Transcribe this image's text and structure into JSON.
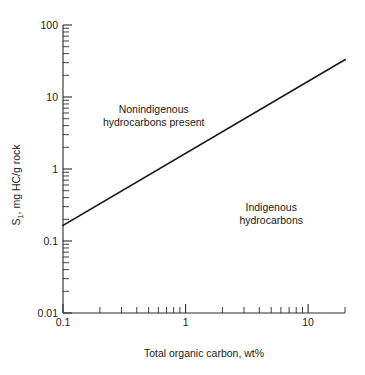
{
  "chart_data": {
    "type": "line",
    "title": "",
    "subtitle": "",
    "xlabel": "Total organic carbon, wt%",
    "ylabel": "S1, mg HC/g rock",
    "ylabel_parts": {
      "base": "S",
      "subscript": "1",
      "rest": ", mg HC/g rock"
    },
    "xscale": "log",
    "yscale": "log",
    "xlim": [
      0.1,
      20
    ],
    "ylim": [
      0.01,
      100
    ],
    "grid": false,
    "legend": "none",
    "x_major_ticks": [
      0.1,
      1,
      10
    ],
    "x_major_tick_labels": [
      "0.1",
      "1",
      "10"
    ],
    "x_minor_ticks": [
      0.2,
      0.3,
      0.4,
      0.5,
      0.6,
      0.7,
      0.8,
      0.9,
      2,
      3,
      4,
      5,
      6,
      7,
      8,
      9,
      20
    ],
    "y_major_ticks": [
      0.01,
      0.1,
      1,
      10,
      100
    ],
    "y_major_tick_labels": [
      "0.01",
      "0.1",
      "1",
      "10",
      "100"
    ],
    "y_minor_ticks": [
      0.02,
      0.03,
      0.04,
      0.05,
      0.06,
      0.07,
      0.08,
      0.09,
      0.2,
      0.3,
      0.4,
      0.5,
      0.6,
      0.7,
      0.8,
      0.9,
      2,
      3,
      4,
      5,
      6,
      7,
      8,
      9,
      20,
      30,
      40,
      50,
      60,
      70,
      80,
      90
    ],
    "series": [
      {
        "name": "discriminant line",
        "type": "line",
        "color": "#1a1a1a",
        "width": 1.6,
        "x": [
          0.1,
          20
        ],
        "y": [
          0.165,
          33
        ],
        "relationship": "S1 = 1.65 x TOC (slope 1 on log-log)"
      }
    ],
    "annotations": [
      {
        "name": "upper-region-label",
        "lines": [
          "Nonindigenous",
          "hydrocarbons present"
        ],
        "x": 0.55,
        "y": 6.0,
        "align": "middle"
      },
      {
        "name": "lower-region-label",
        "lines": [
          "Indigenous",
          "hydrocarbons"
        ],
        "x": 5.0,
        "y": 0.26,
        "align": "middle"
      }
    ]
  },
  "axes": {
    "x_title": "Total organic carbon, wt%",
    "y_title_base": "S",
    "y_title_sub": "1",
    "y_title_rest": ", mg HC/g rock",
    "x_labels": [
      "0.1",
      "1",
      "10"
    ],
    "y_labels": [
      "0.01",
      "0.1",
      "1",
      "10",
      "100"
    ]
  },
  "annotations": {
    "upper_line_1": "Nonindigenous",
    "upper_line_2": "hydrocarbons present",
    "lower_line_1": "Indigenous",
    "lower_line_2": "hydrocarbons"
  },
  "colors": {
    "background": "#ffffff",
    "ink": "#1a1a1a",
    "axis": "#2b2b2b"
  }
}
